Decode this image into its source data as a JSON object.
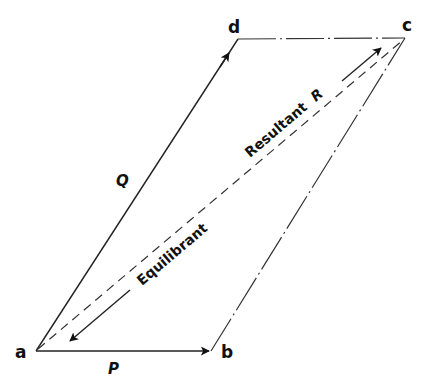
{
  "diagram": {
    "vertices": {
      "a": {
        "label": "a",
        "x": 36,
        "y": 351
      },
      "b": {
        "label": "b",
        "x": 211,
        "y": 351
      },
      "c": {
        "label": "c",
        "x": 405,
        "y": 38
      },
      "d": {
        "label": "d",
        "x": 238,
        "y": 39
      }
    },
    "forces": {
      "P": {
        "label": "P",
        "from": "a",
        "to": "b",
        "style": "solid-arrow"
      },
      "Q": {
        "label": "Q",
        "from": "a",
        "to": "d",
        "style": "solid-arrow"
      }
    },
    "construction_edges": [
      {
        "from": "d",
        "to": "c",
        "style": "dash-dot"
      },
      {
        "from": "b",
        "to": "c",
        "style": "dash-dot"
      }
    ],
    "diagonal": {
      "from": "a",
      "to": "c",
      "style": "dashed"
    },
    "resultant": {
      "label": "Resultant",
      "symbol": "R",
      "direction": "a-to-c"
    },
    "equilibrant": {
      "label": "Equilibrant",
      "direction": "c-to-a"
    }
  }
}
